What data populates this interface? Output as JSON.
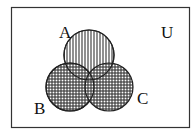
{
  "diagram": {
    "type": "venn",
    "universe_label": "U",
    "sets": [
      {
        "id": "A",
        "label": "A",
        "fill_pattern": "vertical-lines"
      },
      {
        "id": "B",
        "label": "B",
        "fill_pattern": "crosshatch"
      },
      {
        "id": "C",
        "label": "C",
        "fill_pattern": "crosshatch"
      }
    ],
    "shaded_regions": [
      "A",
      "B",
      "C",
      "A∩B",
      "A∩C",
      "B∩C",
      "A∩B∩C"
    ],
    "colors": {
      "stroke": "#222222",
      "hatch": "#333333",
      "background": "#ffffff"
    }
  }
}
